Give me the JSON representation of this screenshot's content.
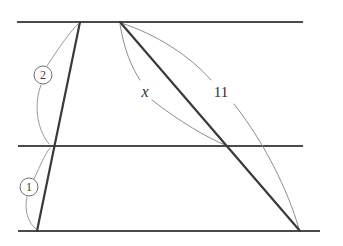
{
  "figure": {
    "background_color": "#ffffff",
    "width": 343,
    "height": 246
  },
  "colors": {
    "parallel_line": "#4a4a4a",
    "transversal": "#3a3a3a",
    "arc": "#8e8e8e",
    "callout_stroke": "#6f6f6f",
    "label_text": "#2f2f2f"
  },
  "parallel_lines": [
    {
      "id": "top-line",
      "name": "top parallel line",
      "x1": 17,
      "y1": 22,
      "x2": 303,
      "y2": 22
    },
    {
      "id": "middle-line",
      "name": "middle parallel line",
      "x1": 18,
      "y1": 146,
      "x2": 303,
      "y2": 146
    },
    {
      "id": "bottom-line",
      "name": "bottom parallel line",
      "x1": 18,
      "y1": 231,
      "x2": 320,
      "y2": 231
    }
  ],
  "transversals": [
    {
      "id": "left-transversal",
      "name": "left transversal",
      "x1": 80,
      "y1": 22,
      "x2": 37,
      "y2": 231
    },
    {
      "id": "right-transversal",
      "name": "right transversal",
      "x1": 120,
      "y1": 22,
      "x2": 300,
      "y2": 231
    }
  ],
  "intersections": [
    {
      "name": "left-transversal-middle-line",
      "x": 52,
      "y": 146
    },
    {
      "name": "right-transversal-middle-line",
      "x": 227,
      "y": 146
    }
  ],
  "callouts": [
    {
      "id": "callout-2",
      "label": "2",
      "circle": {
        "cx": 43,
        "cy": 75,
        "r": 9
      },
      "segment_described": "upper part of left transversal",
      "leader_up": "M 47 66 C 56 52 68 34 78 24",
      "leader_down": "M 41 85 C 34 103 36 128 49 144"
    },
    {
      "id": "callout-1",
      "label": "1",
      "circle": {
        "cx": 29,
        "cy": 187,
        "r": 9
      },
      "segment_described": "lower part of left transversal",
      "leader_up": "M 34 179 C 40 166 45 154 50 148",
      "leader_down": "M 27 197 C 24 210 28 223 36 229"
    }
  ],
  "measurements": [
    {
      "id": "measure-x",
      "label": "x",
      "style": "italic",
      "label_x": 145,
      "label_y": 91,
      "describes": "segment from apex to middle-line intersection",
      "arc_upper": "M 120 24 C 124 50 132 68 140 80",
      "arc_lower": "M 152 100 C 180 122 208 138 225 145"
    },
    {
      "id": "measure-11",
      "label": "11",
      "style": "upright",
      "label_x": 221,
      "label_y": 92,
      "describes": "segment from apex to bottom-line endpoint",
      "arc_upper": "M 121 23 C 156 34 190 56 211 80",
      "arc_lower": "M 234 104 C 264 142 288 190 299 229"
    }
  ]
}
